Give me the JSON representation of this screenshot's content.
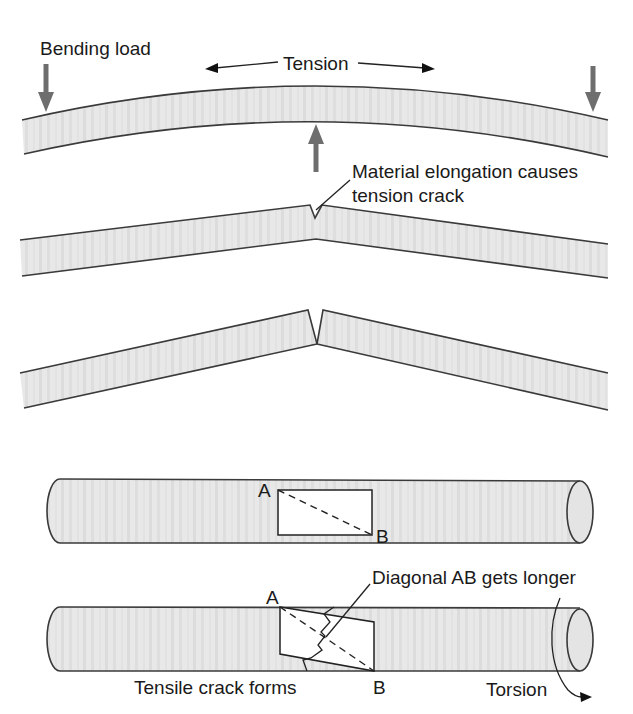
{
  "figure": {
    "panels": [
      {
        "id": "bending",
        "labels": {
          "bending_load": "Bending load",
          "tension": "Tension",
          "crack_note_line1": "Material elongation causes",
          "crack_note_line2": "tension crack"
        },
        "stages": [
          "bent-beam",
          "cracking-beam",
          "fractured-beam"
        ]
      },
      {
        "id": "torsion",
        "labels": {
          "point_a_top": "A",
          "point_b_top": "B",
          "point_a_bottom": "A",
          "point_b_bottom": "B",
          "diagonal_note": "Diagonal AB gets longer",
          "crack_note": "Tensile crack forms",
          "torsion": "Torsion"
        },
        "stages": [
          "untwisted-bar",
          "twisted-bar"
        ]
      }
    ],
    "colors": {
      "beam_fill": "#e6e6e6",
      "beam_outline": "#3a3a3a",
      "load_arrow": "#6e6e6e",
      "text": "#1a1a1a"
    }
  }
}
